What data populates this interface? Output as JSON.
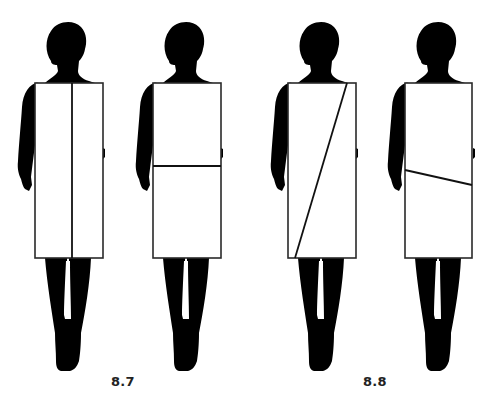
{
  "colors": {
    "silhouette": "#000000",
    "garment_fill": "#ffffff",
    "garment_outline": "#2a2a2a",
    "division_line": "#111111",
    "background": "#ffffff"
  },
  "figures": [
    {
      "id": "fig-1",
      "group": "8.7",
      "division": "vertical",
      "description": "Rectangle split by a vertical center line"
    },
    {
      "id": "fig-2",
      "group": "8.7",
      "division": "horizontal",
      "description": "Rectangle split by a horizontal line at the hip"
    },
    {
      "id": "fig-3",
      "group": "8.8",
      "division": "diagonal",
      "description": "Rectangle split by a steep diagonal line"
    },
    {
      "id": "fig-4",
      "group": "8.8",
      "division": "slanted-horizontal",
      "description": "Rectangle split by a slightly slanted hip line"
    }
  ],
  "captions": [
    {
      "label": "8.7"
    },
    {
      "label": "8.8"
    }
  ]
}
